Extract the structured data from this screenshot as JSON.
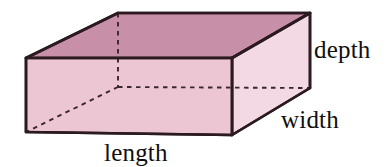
{
  "figure": {
    "name": "rectangular-prism-diagram",
    "shape": "rectangular box / cuboid",
    "background_color": "#ffffff",
    "outline_color": "#2b1a20",
    "faces": {
      "top": {
        "name": "top-face",
        "color": "#c78fa8"
      },
      "front": {
        "name": "front-face",
        "color": "#edc6d4"
      },
      "right": {
        "name": "right-face",
        "color": "#f2d9e3"
      }
    },
    "hidden_edges": {
      "name": "hidden-edges",
      "style": "dashed",
      "color": "#3a2630"
    }
  },
  "labels": {
    "depth": "depth",
    "width": "width",
    "length": "length"
  },
  "geometry": {
    "front_top_left": [
      26,
      58
    ],
    "front_top_right": [
      232,
      58
    ],
    "front_bottom_left": [
      26,
      132
    ],
    "front_bottom_right": [
      232,
      135
    ],
    "back_top_left": [
      118,
      13
    ],
    "back_top_right": [
      310,
      13
    ],
    "back_bottom_right": [
      310,
      88
    ],
    "hidden_back_bottom_left": [
      118,
      87
    ]
  }
}
